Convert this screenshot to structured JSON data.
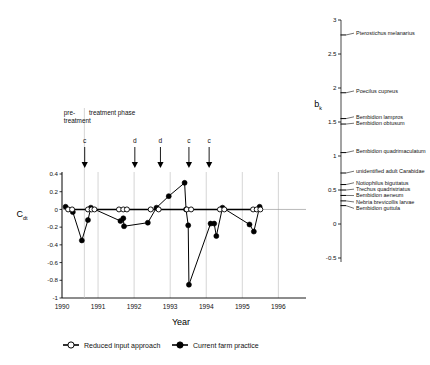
{
  "header": {
    "text": ""
  },
  "chart_data": {
    "type": "line",
    "title": "",
    "xlabel": "Year",
    "ylabel": "Cdt",
    "ylabel_base": "C",
    "ylabel_sub": "dt",
    "xlim": [
      1990,
      1996.6
    ],
    "ylim": [
      -1,
      0.4
    ],
    "yticks": [
      0.4,
      0.2,
      0,
      -0.2,
      -0.4,
      -0.6,
      -0.8,
      -1
    ],
    "ytick_labels": [
      "0.4",
      "0.2",
      "0",
      "-0.2",
      "-0.4",
      "-0.6",
      "-0.8",
      "-1"
    ],
    "xticks": [
      1990,
      1991,
      1992,
      1993,
      1994,
      1995,
      1996
    ],
    "xtick_labels": [
      "1990",
      "1991",
      "1992",
      "1993",
      "1994",
      "1995",
      "1996"
    ],
    "grid": "vertical",
    "zero_line": true,
    "phase_labels": [
      {
        "text_line1": "pre-",
        "text_line2": "treatment",
        "x": 1990.05
      },
      {
        "text_line1": "treatment phase",
        "text_line2": "",
        "x": 1990.75
      }
    ],
    "phase_divider_x": 1990.62,
    "event_arrows": [
      {
        "label": "c",
        "x": 1990.63
      },
      {
        "label": "d",
        "x": 1992.02
      },
      {
        "label": "d",
        "x": 1992.73
      },
      {
        "label": "c",
        "x": 1993.52
      },
      {
        "label": "c",
        "x": 1994.08
      }
    ],
    "series": [
      {
        "name": "Reduced input approach",
        "marker": "open-circle",
        "key": "reduced",
        "points": [
          [
            1990.17,
            0.0
          ],
          [
            1990.28,
            0.0
          ],
          [
            1990.72,
            0.0
          ],
          [
            1990.82,
            0.0
          ],
          [
            1990.9,
            0.0
          ],
          [
            1991.58,
            0.0
          ],
          [
            1991.7,
            0.0
          ],
          [
            1991.8,
            0.0
          ],
          [
            1992.46,
            0.0
          ],
          [
            1992.68,
            0.0
          ],
          [
            1993.46,
            0.0
          ],
          [
            1993.58,
            0.0
          ],
          [
            1994.38,
            0.0
          ],
          [
            1994.5,
            0.0
          ],
          [
            1995.3,
            0.0
          ],
          [
            1995.4,
            0.0
          ],
          [
            1995.5,
            0.0
          ]
        ]
      },
      {
        "name": "Current farm practice",
        "marker": "filled-circle",
        "key": "current",
        "points": [
          [
            1990.1,
            0.03
          ],
          [
            1990.3,
            -0.03
          ],
          [
            1990.55,
            -0.35
          ],
          [
            1990.72,
            -0.12
          ],
          [
            1990.8,
            0.02
          ],
          [
            1991.62,
            -0.13
          ],
          [
            1991.7,
            -0.1
          ],
          [
            1991.72,
            -0.19
          ],
          [
            1992.38,
            -0.15
          ],
          [
            1992.62,
            0.02
          ],
          [
            1992.96,
            0.15
          ],
          [
            1993.4,
            0.3
          ],
          [
            1993.44,
            0.0
          ],
          [
            1993.5,
            -0.18
          ],
          [
            1993.52,
            -0.85
          ],
          [
            1994.12,
            -0.16
          ],
          [
            1994.22,
            -0.16
          ],
          [
            1994.28,
            -0.3
          ],
          [
            1994.45,
            0.02
          ],
          [
            1995.2,
            -0.17
          ],
          [
            1995.32,
            -0.25
          ],
          [
            1995.48,
            0.03
          ]
        ]
      }
    ]
  },
  "right_panel": {
    "axis_label_base": "b",
    "axis_label_sub": "k",
    "ylim": [
      -0.5,
      3
    ],
    "yticks": [
      3,
      2.5,
      2,
      1.5,
      1,
      0.5,
      0,
      -0.5
    ],
    "ytick_labels": [
      "3",
      "2.5",
      "2",
      "1.5",
      "1",
      "0.5",
      "0",
      "-0.5"
    ],
    "species": [
      {
        "label": "Pterostichus melanarius",
        "value": 2.78
      },
      {
        "label": "Poecilus cupreus",
        "value": 1.93
      },
      {
        "label": "Bembidion lampros",
        "value": 1.55
      },
      {
        "label": "Bembidion obtusum",
        "value": 1.47
      },
      {
        "label": "Bembidion quadrimaculatum",
        "value": 1.05
      },
      {
        "label": "unidentified adult Carabidae",
        "value": 0.75
      },
      {
        "label": "Notiophilus biguttatus",
        "value": 0.58
      },
      {
        "label": "Trechus quadristriatus",
        "value": 0.5
      },
      {
        "label": "Bembidion aeneum",
        "value": 0.42
      },
      {
        "label": "Nebria brevicollis larvae",
        "value": 0.34
      },
      {
        "label": "Bembidion guttula",
        "value": 0.27
      }
    ]
  },
  "legend": {
    "items": [
      {
        "label": "Reduced input approach",
        "marker": "open-circle"
      },
      {
        "label": "Current farm practice",
        "marker": "filled-circle"
      }
    ]
  }
}
